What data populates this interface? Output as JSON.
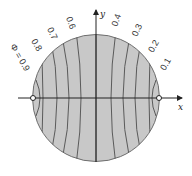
{
  "figure": {
    "axes": {
      "x_label": "x",
      "y_label": "y"
    },
    "colors": {
      "disk_fill": "#c8c8c8",
      "disk_stroke": "#6e6e6e",
      "curve": "#5a5a5a",
      "axis": "#222222"
    },
    "curve_labels": [
      {
        "id": "phi-09",
        "text": "Φ = 0.9"
      },
      {
        "id": "phi-08",
        "text": "0.8"
      },
      {
        "id": "phi-07",
        "text": "0.7"
      },
      {
        "id": "phi-06",
        "text": "0.6"
      },
      {
        "id": "phi-04",
        "text": "0.4"
      },
      {
        "id": "phi-03",
        "text": "0.3"
      },
      {
        "id": "phi-02",
        "text": "0.2"
      },
      {
        "id": "phi-01",
        "text": "0.1"
      }
    ]
  }
}
